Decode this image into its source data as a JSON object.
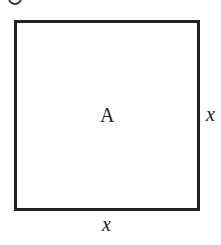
{
  "diagram": {
    "type": "geometry",
    "shape": "square",
    "region_label": "A",
    "side_labels": {
      "right": "x",
      "bottom": "x"
    },
    "stroke_color": "#222222",
    "background_color": "#ffffff"
  }
}
